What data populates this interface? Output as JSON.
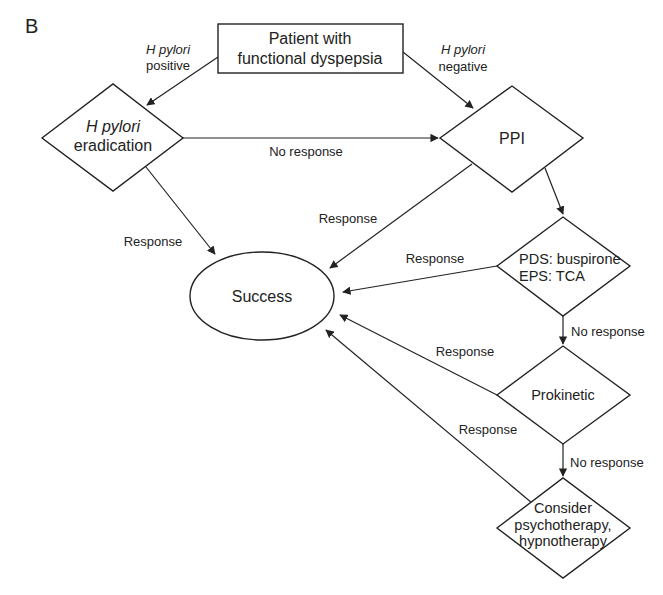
{
  "figure": {
    "panel_label": "B",
    "colors": {
      "stroke": "#222222",
      "text": "#222222",
      "background": "#ffffff"
    }
  },
  "nodes": {
    "start": {
      "shape": "rectangle",
      "line1": "Patient with",
      "line2": "functional dyspepsia"
    },
    "hp_eradication": {
      "shape": "diamond",
      "line1": "H pylori",
      "line2": "eradication"
    },
    "ppi": {
      "shape": "diamond",
      "label": "PPI"
    },
    "success": {
      "shape": "ellipse",
      "label": "Success"
    },
    "pds_eps": {
      "shape": "diamond",
      "line1": "PDS: buspirone",
      "line2": "EPS: TCA"
    },
    "prokinetic": {
      "shape": "diamond",
      "label": "Prokinetic"
    },
    "psych": {
      "shape": "diamond",
      "line1": "Consider",
      "line2": "psychotherapy,",
      "line3": "hypnotherapy"
    }
  },
  "edges": {
    "start_to_hp": {
      "line1": "H pylori",
      "line2": "positive"
    },
    "start_to_ppi": {
      "line1": "H pylori",
      "line2": "negative"
    },
    "hp_to_ppi": {
      "label": "No response"
    },
    "hp_to_success": {
      "label": "Response"
    },
    "ppi_to_success": {
      "label": "Response"
    },
    "pds_to_success": {
      "label": "Response"
    },
    "pds_to_prokinetic": {
      "label": "No response"
    },
    "prokinetic_to_success": {
      "label": "Response"
    },
    "prokinetic_to_psych": {
      "label": "No response"
    },
    "psych_to_success": {
      "label": "Response"
    }
  }
}
